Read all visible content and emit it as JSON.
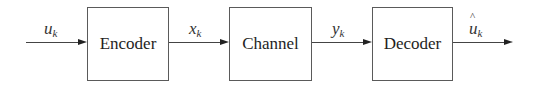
{
  "diagram": {
    "type": "block-diagram",
    "blocks": [
      {
        "id": "encoder",
        "label": "Encoder"
      },
      {
        "id": "channel",
        "label": "Channel"
      },
      {
        "id": "decoder",
        "label": "Decoder"
      }
    ],
    "signals": [
      {
        "id": "input",
        "base": "u",
        "sub": "k",
        "hat": false,
        "from": null,
        "to": "encoder"
      },
      {
        "id": "encoded",
        "base": "x",
        "sub": "k",
        "hat": false,
        "from": "encoder",
        "to": "channel"
      },
      {
        "id": "received",
        "base": "y",
        "sub": "k",
        "hat": false,
        "from": "channel",
        "to": "decoder"
      },
      {
        "id": "output",
        "base": "u",
        "sub": "k",
        "hat": true,
        "from": "decoder",
        "to": null
      }
    ],
    "colors": {
      "background": "#ffffff",
      "stroke": "#5a5a5a",
      "text": "#1e1e1e"
    }
  }
}
